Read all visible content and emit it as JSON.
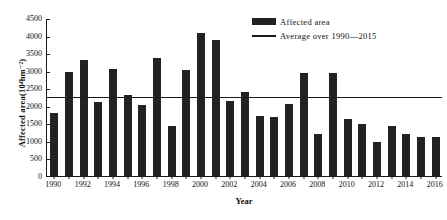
{
  "chart_data": {
    "type": "bar",
    "title": "",
    "xlabel": "Year",
    "ylabel": "Affected area(10⁴hm⁻²)",
    "ylim": [
      0,
      4500
    ],
    "ytick_step": 500,
    "yticks": [
      "0",
      "500",
      "1000",
      "1500",
      "2000",
      "2500",
      "3000",
      "3500",
      "4000",
      "4500"
    ],
    "grid": false,
    "legend_position": "top-right",
    "categories": [
      "1990",
      "1991",
      "1992",
      "1993",
      "1994",
      "1995",
      "1996",
      "1997",
      "1998",
      "1999",
      "2000",
      "2001",
      "2002",
      "2003",
      "2004",
      "2005",
      "2006",
      "2007",
      "2008",
      "2009",
      "2010",
      "2011",
      "2012",
      "2013",
      "2014",
      "2015",
      "2016"
    ],
    "xtick_labels": [
      "1990",
      "1992",
      "1994",
      "1996",
      "1998",
      "2000",
      "2002",
      "2004",
      "2006",
      "2008",
      "2010",
      "2012",
      "2014",
      "2016"
    ],
    "series": [
      {
        "name": "Affected area",
        "type": "bar",
        "color": "#222222",
        "values": [
          1800,
          2950,
          3300,
          2110,
          3050,
          2320,
          2010,
          3350,
          1430,
          3020,
          4060,
          3860,
          2130,
          2400,
          1720,
          1680,
          2060,
          2930,
          1200,
          2920,
          1630,
          1480,
          970,
          1420,
          1200,
          1120,
          1100
        ]
      },
      {
        "name": "Average over 1990—2015",
        "type": "line",
        "color": "#1a1a1a",
        "value": 2230
      }
    ],
    "annotations": []
  },
  "legend": {
    "items": [
      {
        "label": "Affected area",
        "marker": "bar-swatch"
      },
      {
        "label": "Average over 1990—2015",
        "marker": "line-swatch"
      }
    ]
  }
}
